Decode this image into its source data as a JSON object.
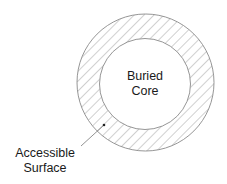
{
  "diagram": {
    "type": "concentric-circles",
    "outer_region": {
      "label_line1": "Accessible",
      "label_line2": "Surface",
      "fill": "diagonal-hatch"
    },
    "inner_region": {
      "label_line1": "Buried",
      "label_line2": "Core",
      "fill": "white"
    },
    "colors": {
      "stroke": "#888888",
      "text": "#1a1a1a",
      "background": "#ffffff"
    }
  }
}
